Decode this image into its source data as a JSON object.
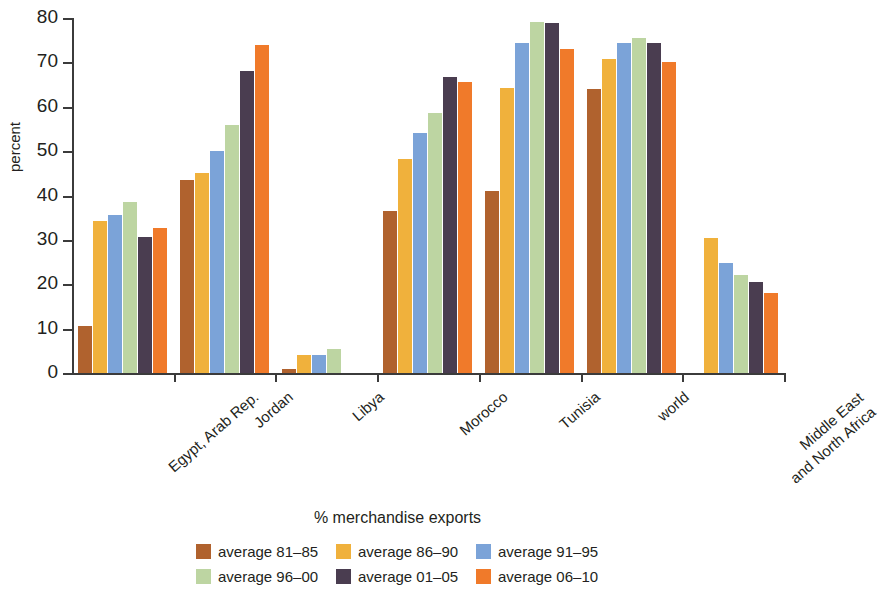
{
  "chart_data": {
    "type": "bar",
    "title": "",
    "subtitle": "",
    "xlabel": "% merchandise exports",
    "ylabel": "percent",
    "ylim": [
      0,
      80
    ],
    "yticks": [
      0,
      10,
      20,
      30,
      40,
      50,
      60,
      70,
      80
    ],
    "ytick_labels": [
      "0",
      "10",
      "20",
      "30",
      "40",
      "50",
      "60",
      "70",
      "80"
    ],
    "grid": false,
    "legend_position": "bottom",
    "categories": [
      "Egypt, Arab Rep.",
      "Jordan",
      "Libya",
      "Morocco",
      "Tunisia",
      "world",
      "Middle East and North Africa"
    ],
    "category_lines": [
      [
        "Egypt, Arab Rep."
      ],
      [
        "Jordan"
      ],
      [
        "Libya"
      ],
      [
        "Morocco"
      ],
      [
        "Tunisia"
      ],
      [
        "world"
      ],
      [
        "Middle East",
        "and North Africa"
      ]
    ],
    "series": [
      {
        "name": "average 81–85",
        "color": "#b0622e",
        "values": [
          10.5,
          43.5,
          1.0,
          36.5,
          41.0,
          64.0,
          0
        ]
      },
      {
        "name": "average 86–90",
        "color": "#f0b13c",
        "values": [
          34.2,
          45.0,
          4.0,
          48.2,
          64.3,
          70.8,
          30.5
        ]
      },
      {
        "name": "average 91–95",
        "color": "#7ba3d8",
        "values": [
          35.7,
          50.0,
          4.0,
          54.0,
          74.3,
          74.3,
          24.7
        ]
      },
      {
        "name": "average 96–00",
        "color": "#bdd5a2",
        "values": [
          38.6,
          56.0,
          5.5,
          58.5,
          79.0,
          75.5,
          22.2
        ]
      },
      {
        "name": "average 01–05",
        "color": "#4a3d50",
        "values": [
          30.6,
          68.0,
          0,
          66.6,
          78.8,
          74.3,
          20.6
        ]
      },
      {
        "name": "average 06–10",
        "color": "#f07a2a",
        "values": [
          32.6,
          74.0,
          0,
          65.6,
          73.0,
          70.2,
          18.0
        ]
      }
    ]
  },
  "legend": {
    "items": [
      {
        "label": "average 81–85",
        "color": "#b0622e"
      },
      {
        "label": "average 86–90",
        "color": "#f0b13c"
      },
      {
        "label": "average 91–95",
        "color": "#7ba3d8"
      },
      {
        "label": "average 96–00",
        "color": "#bdd5a2"
      },
      {
        "label": "average 01–05",
        "color": "#4a3d50"
      },
      {
        "label": "average 06–10",
        "color": "#f07a2a"
      }
    ]
  }
}
